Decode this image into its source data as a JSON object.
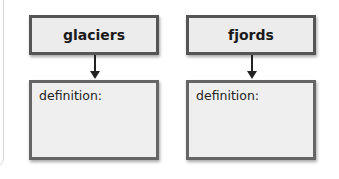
{
  "diagram": {
    "columns": [
      {
        "term": "glaciers",
        "definition_label": "definition:",
        "definition_value": ""
      },
      {
        "term": "fjords",
        "definition_label": "definition:",
        "definition_value": ""
      }
    ]
  },
  "colors": {
    "box_border": "#555555",
    "box_fill": "#ececec",
    "arrow": "#222222"
  }
}
